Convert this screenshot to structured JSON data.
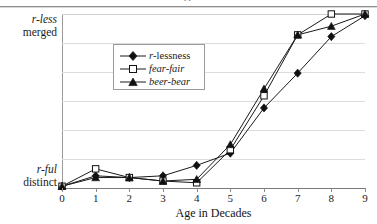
{
  "figure": {
    "cut_caption": "pp",
    "xlabel": "Age in Decades",
    "y_top_line1": "r-less",
    "y_top_line2": "merged",
    "y_bottom_line1": "r-ful",
    "y_bottom_line2": "distinct"
  },
  "legend": {
    "items": [
      {
        "label_prefix": "r",
        "label_rest": "-lessness",
        "marker": "filled-diamond",
        "italic": false
      },
      {
        "label_prefix": "",
        "label_rest": "fear-fair",
        "marker": "open-square",
        "italic": true
      },
      {
        "label_prefix": "",
        "label_rest": "beer-bear",
        "marker": "filled-triangle",
        "italic": true
      }
    ]
  },
  "chart_data": {
    "type": "line",
    "title": "",
    "xlabel": "Age in Decades",
    "ylabel": "",
    "x": [
      0,
      1,
      2,
      3,
      4,
      5,
      6,
      7,
      8,
      9
    ],
    "xlim": [
      0,
      9
    ],
    "ylim": [
      0,
      1
    ],
    "ytick_labels": [
      "r-ful distinct",
      "r-less merged"
    ],
    "ytick_values": [
      0,
      1
    ],
    "grid": "horizontal",
    "legend_position": "upper-left-inset",
    "series": [
      {
        "name": "r-lessness",
        "marker": "filled-diamond",
        "values": [
          0.01,
          0.07,
          0.06,
          0.07,
          0.13,
          0.2,
          0.46,
          0.66,
          0.87,
          0.99
        ]
      },
      {
        "name": "fear-fair",
        "marker": "open-square",
        "values": [
          0.01,
          0.11,
          0.06,
          0.04,
          0.03,
          0.22,
          0.53,
          0.88,
          1.0,
          1.0
        ]
      },
      {
        "name": "beer-bear",
        "marker": "filled-triangle",
        "values": [
          0.01,
          0.06,
          0.06,
          0.04,
          0.05,
          0.25,
          0.57,
          0.88,
          0.93,
          1.0
        ]
      }
    ]
  }
}
